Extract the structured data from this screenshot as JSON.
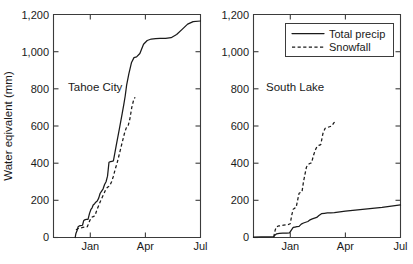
{
  "figure": {
    "background": "#ffffff",
    "line_color": "#1a1a1a",
    "axis_color": "#3b3b3b"
  },
  "axis": {
    "ylabel": "Water eqivalent (mm)",
    "yticks": [
      "0",
      "200",
      "400",
      "600",
      "800",
      "1,000",
      "1,200"
    ],
    "ytick_values": [
      0,
      200,
      400,
      600,
      800,
      1000,
      1200
    ],
    "xticks": [
      "Jan",
      "Apr",
      "Jul"
    ],
    "xtick_values": [
      2.0,
      5.0,
      8.0
    ],
    "ylim": [
      0,
      1200
    ],
    "xlim": [
      0.0,
      8.0
    ]
  },
  "legend": {
    "position": "top-right-panel2",
    "entries": [
      {
        "label": "Total precip",
        "style": "solid"
      },
      {
        "label": "Snowfall",
        "style": "dashed"
      }
    ]
  },
  "panels": [
    {
      "id": "tahoe-city",
      "label": "Tahoe City"
    },
    {
      "id": "south-lake",
      "label": "South Lake"
    }
  ],
  "chart_data": {
    "type": "line",
    "title": "",
    "xlabel": "",
    "ylabel": "Water eqivalent (mm)",
    "xlim": [
      0.0,
      8.0
    ],
    "ylim": [
      0,
      1200
    ],
    "grid": false,
    "legend_position": "upper-right of right panel",
    "xtick_labels": [
      "Jan",
      "Apr",
      "Jul"
    ],
    "xtick_positions": [
      2.0,
      5.0,
      8.0
    ],
    "ytick_labels": [
      "0",
      "200",
      "400",
      "600",
      "800",
      "1,000",
      "1,200"
    ],
    "ytick_positions": [
      0,
      200,
      400,
      600,
      800,
      1000,
      1200
    ],
    "x_units": "months from start of water year (Nov=0, Jan=2, Apr=5, Jul=8)",
    "panels": [
      {
        "name": "Tahoe City",
        "series": [
          {
            "name": "Total precip",
            "style": "solid",
            "x": [
              1.18,
              1.22,
              1.3,
              1.34,
              1.4,
              1.48,
              1.58,
              1.64,
              1.7,
              1.78,
              1.88,
              1.96,
              2.04,
              2.1,
              2.16,
              2.24,
              2.3,
              2.38,
              2.46,
              2.54,
              2.62,
              2.7,
              2.78,
              2.86,
              2.94,
              3.02,
              3.1,
              3.18,
              3.26,
              3.34,
              3.42,
              3.5,
              3.58,
              3.66,
              3.74,
              3.82,
              3.9,
              3.98,
              4.1,
              4.24,
              4.38,
              4.52,
              4.7,
              4.9,
              5.1,
              5.32,
              5.56,
              5.8,
              6.1,
              6.4,
              6.7,
              7.0,
              7.3,
              7.6,
              8.0
            ],
            "y": [
              0,
              22,
              42,
              58,
              62,
              64,
              66,
              90,
              95,
              97,
              98,
              130,
              152,
              160,
              175,
              182,
              190,
              196,
              212,
              238,
              250,
              262,
              285,
              300,
              330,
              405,
              408,
              410,
              412,
              455,
              498,
              540,
              582,
              625,
              668,
              712,
              760,
              820,
              880,
              940,
              968,
              972,
              990,
              1040,
              1060,
              1068,
              1070,
              1072,
              1072,
              1075,
              1092,
              1120,
              1148,
              1162,
              1165
            ]
          },
          {
            "name": "Snowfall",
            "style": "dashed",
            "x": [
              1.22,
              1.3,
              1.38,
              1.48,
              1.6,
              1.72,
              1.84,
              1.96,
              2.06,
              2.16,
              2.26,
              2.36,
              2.46,
              2.56,
              2.66,
              2.76,
              2.86,
              2.96,
              3.06,
              3.16,
              3.26,
              3.36,
              3.46,
              3.56,
              3.66,
              3.76,
              3.86,
              3.96,
              4.06,
              4.16,
              4.26,
              4.36,
              4.44
            ],
            "y": [
              42,
              46,
              50,
              52,
              54,
              56,
              58,
              88,
              108,
              112,
              118,
              148,
              172,
              196,
              218,
              240,
              262,
              272,
              278,
              300,
              330,
              368,
              400,
              440,
              480,
              520,
              560,
              590,
              600,
              640,
              700,
              740,
              755
            ]
          }
        ]
      },
      {
        "name": "South Lake",
        "series": [
          {
            "name": "Total precip",
            "style": "solid",
            "x": [
              0.0,
              0.4,
              0.8,
              1.1,
              1.18,
              1.26,
              1.4,
              1.6,
              1.8,
              1.96,
              2.06,
              2.16,
              2.26,
              2.36,
              2.48,
              2.6,
              2.72,
              2.84,
              2.96,
              3.08,
              3.2,
              3.32,
              3.44,
              3.56,
              3.7,
              3.86,
              4.02,
              4.2,
              4.4,
              4.7,
              5.0,
              5.4,
              5.8,
              6.2,
              6.6,
              7.0,
              7.4,
              7.7,
              8.0
            ],
            "y": [
              2,
              3,
              4,
              5,
              14,
              20,
              22,
              23,
              24,
              25,
              40,
              54,
              56,
              58,
              60,
              72,
              78,
              82,
              86,
              95,
              100,
              104,
              108,
              118,
              128,
              130,
              132,
              132,
              134,
              138,
              142,
              146,
              150,
              154,
              158,
              162,
              168,
              172,
              175
            ]
          },
          {
            "name": "Snowfall",
            "style": "dashed",
            "x": [
              1.1,
              1.18,
              1.26,
              1.36,
              1.5,
              1.64,
              1.78,
              1.9,
              2.0,
              2.08,
              2.16,
              2.24,
              2.32,
              2.4,
              2.48,
              2.56,
              2.64,
              2.72,
              2.8,
              2.88,
              2.96,
              3.06,
              3.16,
              3.26,
              3.36,
              3.46,
              3.56,
              3.66,
              3.78,
              3.9,
              4.02,
              4.14,
              4.26,
              4.38,
              4.5
            ],
            "y": [
              2,
              40,
              58,
              62,
              64,
              66,
              68,
              70,
              74,
              120,
              152,
              158,
              162,
              200,
              238,
              242,
              246,
              300,
              340,
              378,
              392,
              398,
              402,
              440,
              470,
              490,
              496,
              500,
              560,
              588,
              592,
              596,
              600,
              618,
              628
            ]
          }
        ]
      }
    ]
  }
}
